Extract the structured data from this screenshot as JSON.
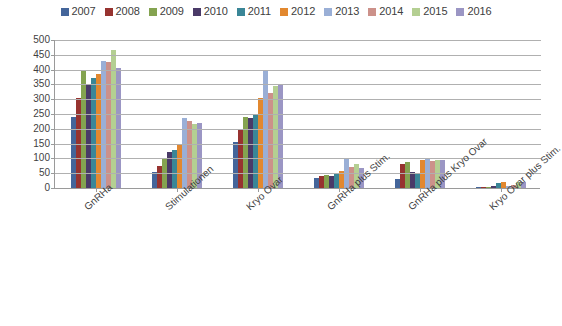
{
  "chart_data": {
    "type": "bar",
    "title": "",
    "subtitle": "",
    "xlabel": "",
    "ylabel": "",
    "ylim": [
      0,
      500
    ],
    "ytick_step": 50,
    "yticks": [
      500,
      450,
      400,
      350,
      300,
      250,
      200,
      150,
      100,
      50,
      0
    ],
    "grid": "horizontal",
    "legend_position": "top",
    "categories": [
      "GnRHa",
      "Stimulationen",
      "Kryo Ovar",
      "GnRHa plus Stim.",
      "GnRHa plus Kryo Ovar",
      "Kryo Ovar plus Stim."
    ],
    "series": [
      {
        "name": "2007",
        "color": "#44659a",
        "values": [
          240,
          55,
          155,
          35,
          30,
          2
        ]
      },
      {
        "name": "2008",
        "color": "#973330",
        "values": [
          305,
          75,
          195,
          42,
          80,
          3
        ]
      },
      {
        "name": "2009",
        "color": "#84a350",
        "values": [
          400,
          100,
          240,
          45,
          88,
          4
        ]
      },
      {
        "name": "2010",
        "color": "#4a3a68",
        "values": [
          350,
          120,
          235,
          42,
          55,
          8
        ]
      },
      {
        "name": "2011",
        "color": "#3a8697",
        "values": [
          370,
          130,
          248,
          48,
          52,
          18
        ]
      },
      {
        "name": "2012",
        "color": "#e2882f",
        "values": [
          385,
          150,
          305,
          58,
          95,
          20
        ]
      },
      {
        "name": "2013",
        "color": "#9aafd6",
        "values": [
          430,
          235,
          395,
          100,
          98,
          8
        ]
      },
      {
        "name": "2014",
        "color": "#cc918a",
        "values": [
          425,
          225,
          320,
          72,
          92,
          10
        ]
      },
      {
        "name": "2015",
        "color": "#b4cf92",
        "values": [
          465,
          215,
          345,
          80,
          95,
          22
        ]
      },
      {
        "name": "2016",
        "color": "#9b96c4",
        "values": [
          405,
          218,
          348,
          68,
          95,
          20
        ]
      }
    ]
  },
  "legend": {
    "items": [
      {
        "label": "2007"
      },
      {
        "label": "2008"
      },
      {
        "label": "2009"
      },
      {
        "label": "2010"
      },
      {
        "label": "2011"
      },
      {
        "label": "2012"
      },
      {
        "label": "2013"
      },
      {
        "label": "2014"
      },
      {
        "label": "2015"
      },
      {
        "label": "2016"
      }
    ]
  }
}
